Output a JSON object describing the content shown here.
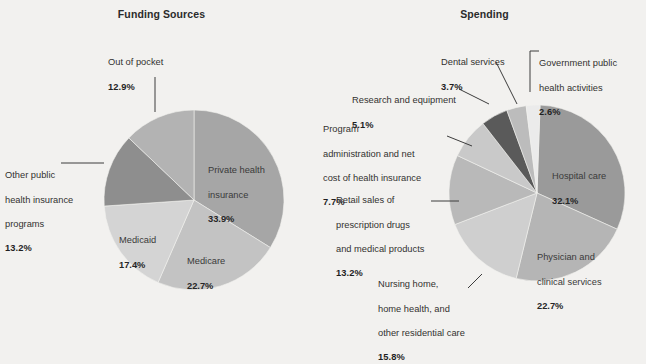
{
  "figure": {
    "background_color": "#f2f1ef",
    "panels": [
      {
        "key": "funding",
        "title": "Funding Sources"
      },
      {
        "key": "spending",
        "title": "Spending"
      }
    ]
  },
  "chart_data": [
    {
      "type": "pie",
      "title": "Funding Sources",
      "xlabel": "",
      "ylabel": "",
      "legend_position": "none",
      "grid": false,
      "units": "percent",
      "categories": [
        "Private health insurance",
        "Medicare",
        "Medicaid",
        "Other public health insurance programs",
        "Out of pocket"
      ],
      "values": [
        33.9,
        22.7,
        17.4,
        13.2,
        12.9
      ],
      "slice_colors": [
        "#a6a6a6",
        "#c3c3c3",
        "#d4d4d4",
        "#8e8e8e",
        "#b3b3b3"
      ],
      "labels": [
        {
          "name": "Private health insurance",
          "text": "Private health\ninsurance",
          "pct": "33.9%",
          "placement": "inside"
        },
        {
          "name": "Medicare",
          "text": "Medicare",
          "pct": "22.7%",
          "placement": "inside"
        },
        {
          "name": "Medicaid",
          "text": "Medicaid",
          "pct": "17.4%",
          "placement": "inside"
        },
        {
          "name": "Other public health insurance programs",
          "text": "Other public\nhealth insurance\nprograms",
          "pct": "13.2%",
          "placement": "outside-left"
        },
        {
          "name": "Out of pocket",
          "text": "Out of pocket",
          "pct": "12.9%",
          "placement": "outside-top"
        }
      ]
    },
    {
      "type": "pie",
      "title": "Spending",
      "xlabel": "",
      "ylabel": "",
      "legend_position": "none",
      "grid": false,
      "units": "percent",
      "categories": [
        "Hospital care",
        "Physician and clinical services",
        "Nursing home, home health, and other residential care",
        "Retail sales of prescription drugs and medical products",
        "Program administration and net cost of health insurance",
        "Research and equipment",
        "Dental services",
        "Government public health activities"
      ],
      "values": [
        32.1,
        22.7,
        15.8,
        13.2,
        7.7,
        5.1,
        3.7,
        2.6
      ],
      "slice_colors": [
        "#9a9a9a",
        "#b5b5b5",
        "#cfcfcf",
        "#b9b9b9",
        "#c9c9c9",
        "#5a5a5a",
        "#bcbcbc",
        "#ebebeb"
      ],
      "labels": [
        {
          "name": "Hospital care",
          "text": "Hospital care",
          "pct": "32.1%",
          "placement": "inside"
        },
        {
          "name": "Physician and clinical services",
          "text": "Physician and\nclinical services",
          "pct": "22.7%",
          "placement": "inside"
        },
        {
          "name": "Nursing home, home health, and other residential care",
          "text": "Nursing home,\nhome health, and\nother residential care",
          "pct": "15.8%",
          "placement": "outside-bottom-left"
        },
        {
          "name": "Retail sales of prescription drugs and medical products",
          "text": "Retail sales of\nprescription drugs\nand medical products",
          "pct": "13.2%",
          "placement": "outside-left"
        },
        {
          "name": "Program administration and net cost of health insurance",
          "text": "Program\nadministration and net\ncost of health insurance",
          "pct": "7.7%",
          "placement": "outside-left"
        },
        {
          "name": "Research and equipment",
          "text": "Research and equipment",
          "pct": "5.1%",
          "placement": "outside-left"
        },
        {
          "name": "Dental services",
          "text": "Dental services",
          "pct": "3.7%",
          "placement": "outside-top"
        },
        {
          "name": "Government public health activities",
          "text": "Government public\nhealth activities",
          "pct": "2.6%",
          "placement": "outside-top-right"
        }
      ]
    }
  ],
  "funding": {
    "title": "Funding Sources",
    "private": {
      "name": "Private health insurance",
      "line1": "Private health",
      "line2": "insurance",
      "pct": "33.9%"
    },
    "medicare": {
      "name": "Medicare",
      "line1": "Medicare",
      "pct": "22.7%"
    },
    "medicaid": {
      "name": "Medicaid",
      "line1": "Medicaid",
      "pct": "17.4%"
    },
    "other_public": {
      "name": "Other public health insurance programs",
      "line1": "Other public",
      "line2": "health insurance",
      "line3": "programs",
      "pct": "13.2%"
    },
    "out_of_pocket": {
      "name": "Out of pocket",
      "line1": "Out of pocket",
      "pct": "12.9%"
    }
  },
  "spending": {
    "title": "Spending",
    "hospital": {
      "name": "Hospital care",
      "line1": "Hospital care",
      "pct": "32.1%"
    },
    "physician": {
      "name": "Physician and clinical services",
      "line1": "Physician and",
      "line2": "clinical services",
      "pct": "22.7%"
    },
    "nursing": {
      "name": "Nursing home, home health, and other residential care",
      "line1": "Nursing home,",
      "line2": "home health, and",
      "line3": "other residential care",
      "pct": "15.8%"
    },
    "retail": {
      "name": "Retail sales of prescription drugs and medical products",
      "line1": "Retail sales of",
      "line2": "prescription drugs",
      "line3": "and medical products",
      "pct": "13.2%"
    },
    "program_admin": {
      "name": "Program administration and net cost of health insurance",
      "line1": "Program",
      "line2": "administration and net",
      "line3": "cost of health insurance",
      "pct": "7.7%"
    },
    "research": {
      "name": "Research and equipment",
      "line1": "Research and equipment",
      "pct": "5.1%"
    },
    "dental": {
      "name": "Dental services",
      "line1": "Dental services",
      "pct": "3.7%"
    },
    "gov_public": {
      "name": "Government public health activities",
      "line1": "Government public",
      "line2": "health activities",
      "pct": "2.6%"
    }
  }
}
